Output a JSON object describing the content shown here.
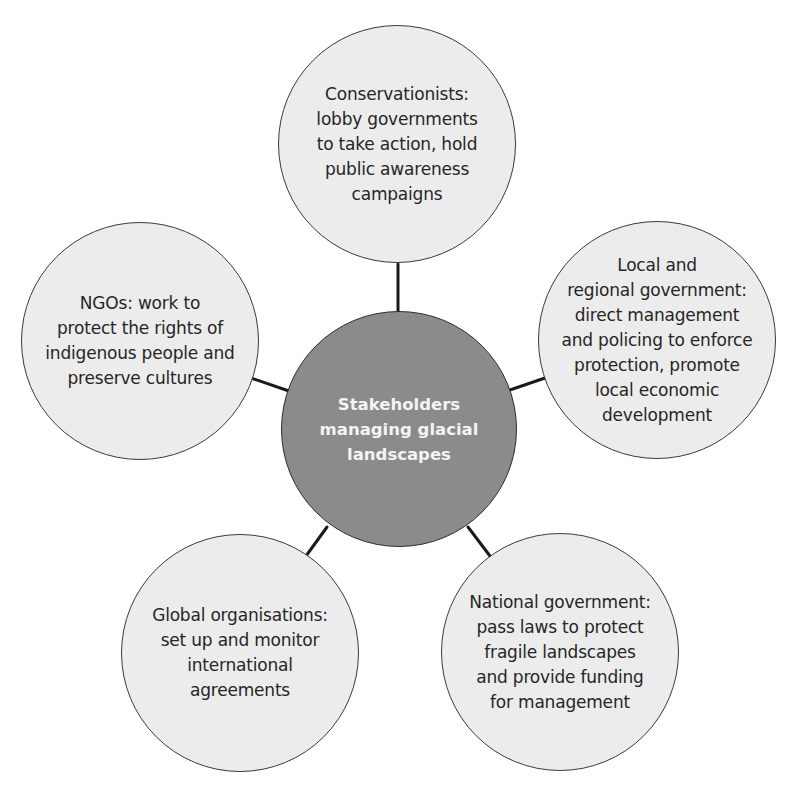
{
  "colors": {
    "background": "#ffffff",
    "outer_fill": "#ececec",
    "hub_fill": "#8b8b8b",
    "outline": "#3a3a3a",
    "connector": "#1a1a1a",
    "outer_text": "#262626",
    "hub_text": "#f4f4f4"
  },
  "hub": {
    "lines": [
      "Stakeholders",
      "managing glacial",
      "landscapes"
    ]
  },
  "stakeholders": [
    {
      "id": "conservationists",
      "lines": [
        "Conservationists:",
        "lobby governments",
        "to take action, hold",
        "public awareness",
        "campaigns"
      ]
    },
    {
      "id": "local-regional-government",
      "lines": [
        "Local and",
        "regional government:",
        "direct management",
        "and policing to enforce",
        "protection, promote",
        "local economic",
        "development"
      ]
    },
    {
      "id": "national-government",
      "lines": [
        "National government:",
        "pass laws to protect",
        "fragile landscapes",
        "and provide funding",
        "for management"
      ]
    },
    {
      "id": "global-organisations",
      "lines": [
        "Global organisations:",
        "set up and monitor",
        "international",
        "agreements"
      ]
    },
    {
      "id": "ngos",
      "lines": [
        "NGOs: work to",
        "protect the rights of",
        "indigenous people and",
        "preserve cultures"
      ]
    }
  ]
}
